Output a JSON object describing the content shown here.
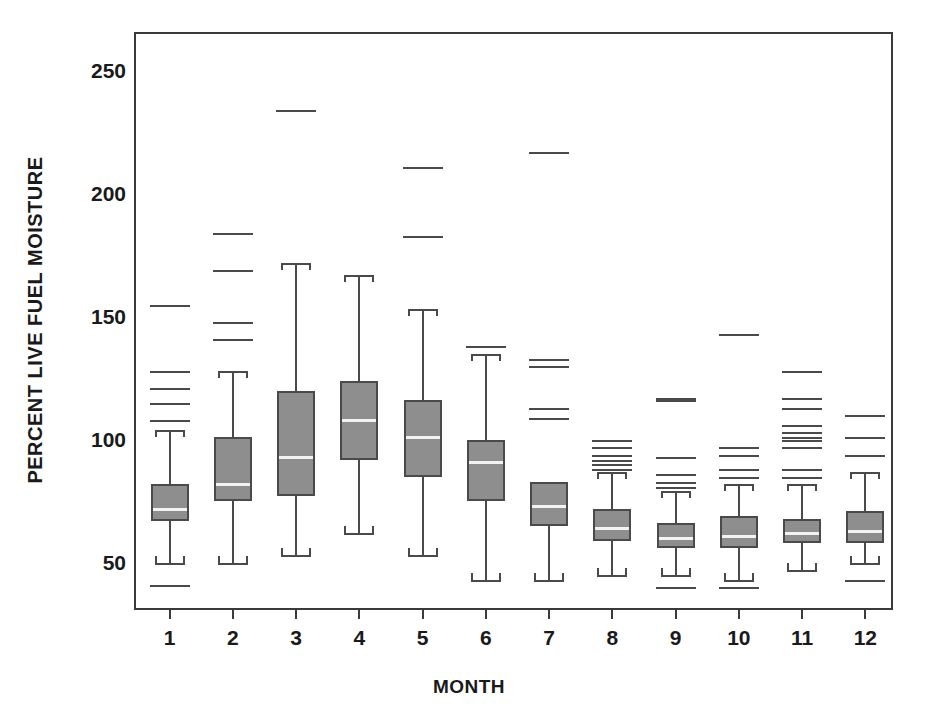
{
  "chart_data": {
    "type": "box",
    "title": "",
    "xlabel": "MONTH",
    "ylabel": "PERCENT LIVE FUEL MOISTURE",
    "categories": [
      "1",
      "2",
      "3",
      "4",
      "5",
      "6",
      "7",
      "8",
      "9",
      "10",
      "11",
      "12"
    ],
    "ylim": [
      30,
      265
    ],
    "yticks": [
      50,
      100,
      150,
      200,
      250
    ],
    "ytick_labels": [
      "50",
      "100",
      "150",
      "200",
      "250"
    ],
    "grid": false,
    "legend": null,
    "boxes": [
      {
        "category": "1",
        "whisker_low": 50,
        "q1": 67,
        "median": 72,
        "q3": 82,
        "whisker_high": 104,
        "outliers_high": [
          155,
          128,
          121,
          115,
          108
        ],
        "outliers_low": [
          41
        ]
      },
      {
        "category": "2",
        "whisker_low": 50,
        "q1": 75,
        "median": 82,
        "q3": 101,
        "whisker_high": 128,
        "outliers_high": [
          184,
          169,
          148,
          141
        ],
        "outliers_low": []
      },
      {
        "category": "3",
        "whisker_low": 53,
        "q1": 77,
        "median": 93,
        "q3": 120,
        "whisker_high": 172,
        "outliers_high": [
          234
        ],
        "outliers_low": []
      },
      {
        "category": "4",
        "whisker_low": 62,
        "q1": 92,
        "median": 108,
        "q3": 124,
        "whisker_high": 167,
        "outliers_high": [],
        "outliers_low": []
      },
      {
        "category": "5",
        "whisker_low": 53,
        "q1": 85,
        "median": 101,
        "q3": 116,
        "whisker_high": 153,
        "outliers_high": [
          211,
          183
        ],
        "outliers_low": []
      },
      {
        "category": "6",
        "whisker_low": 43,
        "q1": 75,
        "median": 91,
        "q3": 100,
        "whisker_high": 135,
        "outliers_high": [
          138
        ],
        "outliers_low": []
      },
      {
        "category": "7",
        "whisker_low": 43,
        "q1": 65,
        "median": 73,
        "q3": 83,
        "whisker_high": null,
        "outliers_high": [
          217,
          133,
          130,
          113,
          109
        ],
        "outliers_low": []
      },
      {
        "category": "8",
        "whisker_low": 45,
        "q1": 59,
        "median": 64,
        "q3": 72,
        "whisker_high": 87,
        "outliers_high": [
          100,
          97,
          94,
          92,
          90,
          88
        ],
        "outliers_low": []
      },
      {
        "category": "9",
        "whisker_low": 45,
        "q1": 56,
        "median": 60,
        "q3": 66,
        "whisker_high": 79,
        "outliers_high": [
          117,
          116,
          93,
          86,
          83,
          81
        ],
        "outliers_low": [
          40
        ]
      },
      {
        "category": "10",
        "whisker_low": 43,
        "q1": 56,
        "median": 61,
        "q3": 69,
        "whisker_high": 82,
        "outliers_high": [
          143,
          97,
          94,
          88,
          85
        ],
        "outliers_low": [
          40
        ]
      },
      {
        "category": "11",
        "whisker_low": 47,
        "q1": 58,
        "median": 62,
        "q3": 68,
        "whisker_high": 82,
        "outliers_high": [
          128,
          117,
          113,
          106,
          103,
          101,
          100,
          97,
          88,
          85
        ],
        "outliers_low": []
      },
      {
        "category": "12",
        "whisker_low": 50,
        "q1": 58,
        "median": 63,
        "q3": 71,
        "whisker_high": 87,
        "outliers_high": [
          110,
          101,
          94
        ],
        "outliers_low": [
          43
        ]
      }
    ]
  },
  "colors": {
    "box_fill": "#8e8e8e",
    "box_stroke": "#4a4a4a",
    "median_line": "#f2f2f2",
    "frame": "#3a3a3a",
    "text": "#1a1a1a",
    "background": "#ffffff"
  }
}
